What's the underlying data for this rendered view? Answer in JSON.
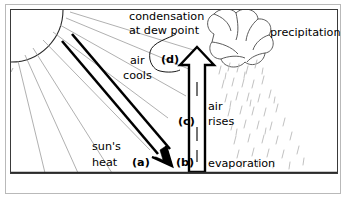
{
  "diagram": {
    "frame": {
      "style": "thin-gray-rectangle"
    },
    "labels": {
      "condensation": "condensation",
      "at_dew_point": "at dew point",
      "precipitation": "precipitation",
      "air": "air",
      "cools": "cools",
      "air2": "air",
      "rises": "rises",
      "evaporation": "evaporation",
      "suns": "sun's",
      "heat": "heat",
      "marker_a": "(a)",
      "marker_b": "(b)",
      "marker_c": "(c)",
      "marker_d": "(d)"
    },
    "elements": [
      {
        "name": "sun",
        "type": "quarter-arc-with-rays",
        "position": "top-left",
        "ray_count": 9
      },
      {
        "name": "suns-heat-arrow",
        "type": "thick-diagonal-arrow",
        "direction": "down-right"
      },
      {
        "name": "air-rises-arrow",
        "type": "hollow-vertical-arrow",
        "direction": "up"
      },
      {
        "name": "cloud",
        "type": "puffy-outline-cloud",
        "position": "top-right"
      },
      {
        "name": "rain",
        "type": "slanted-dashes",
        "streak_count": 48
      },
      {
        "name": "ground-line",
        "type": "horizontal-line"
      },
      {
        "name": "dew-point-pointer",
        "type": "curved-leader-line"
      }
    ],
    "colors": {
      "ink": "#000000",
      "frame": "#b9b9b9",
      "ray": "#9a9a9a",
      "rain": "#b3b3b3",
      "background": "#ffffff"
    }
  }
}
